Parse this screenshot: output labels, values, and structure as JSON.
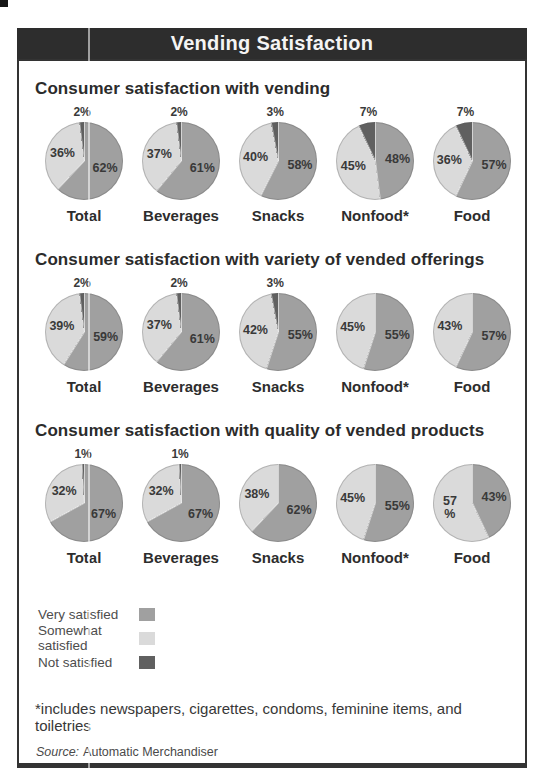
{
  "chart_data": {
    "type": "pie",
    "title": "Vending Satisfaction",
    "colors": {
      "very": "#a0a0a0",
      "somewhat": "#dadada",
      "not": "#606060"
    },
    "legend": [
      {
        "key": "very",
        "label": "Very satisfied"
      },
      {
        "key": "somewhat",
        "label": "Somewhat satisfied"
      },
      {
        "key": "not",
        "label": "Not satisfied"
      }
    ],
    "sections": [
      {
        "heading": "Consumer satisfaction with vending",
        "pies": [
          {
            "category": "Total",
            "very": 62,
            "somewhat": 36,
            "not": 2
          },
          {
            "category": "Beverages",
            "very": 61,
            "somewhat": 37,
            "not": 2
          },
          {
            "category": "Snacks",
            "very": 58,
            "somewhat": 40,
            "not": 3
          },
          {
            "category": "Nonfood*",
            "very": 48,
            "somewhat": 45,
            "not": 7
          },
          {
            "category": "Food",
            "very": 57,
            "somewhat": 36,
            "not": 7
          }
        ]
      },
      {
        "heading": "Consumer satisfaction with variety of vended offerings",
        "pies": [
          {
            "category": "Total",
            "very": 59,
            "somewhat": 39,
            "not": 2
          },
          {
            "category": "Beverages",
            "very": 61,
            "somewhat": 37,
            "not": 2
          },
          {
            "category": "Snacks",
            "very": 55,
            "somewhat": 42,
            "not": 3
          },
          {
            "category": "Nonfood*",
            "very": 55,
            "somewhat": 45,
            "not": 0
          },
          {
            "category": "Food",
            "very": 57,
            "somewhat": 43,
            "not": 0
          }
        ]
      },
      {
        "heading": "Consumer satisfaction with quality of vended products",
        "pies": [
          {
            "category": "Total",
            "very": 67,
            "somewhat": 32,
            "not": 1
          },
          {
            "category": "Beverages",
            "very": 67,
            "somewhat": 32,
            "not": 1
          },
          {
            "category": "Snacks",
            "very": 62,
            "somewhat": 38,
            "not": 0
          },
          {
            "category": "Nonfood*",
            "very": 55,
            "somewhat": 45,
            "not": 0
          },
          {
            "category": "Food",
            "very": 43,
            "somewhat": 57,
            "not": 0,
            "somewhat_label": "57\n%"
          }
        ]
      }
    ],
    "footnote": "*includes newspapers, cigarettes, condoms, feminine items, and toiletries",
    "source_prefix": "Source:",
    "source": "Automatic Merchandiser"
  }
}
